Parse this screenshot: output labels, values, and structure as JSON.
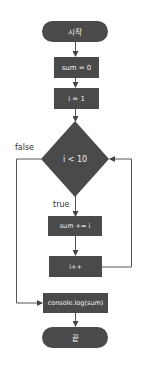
{
  "flowchart": {
    "colors": {
      "node_fill": "#4a4a4a",
      "node_text": "#f2f2f2",
      "line": "#555555",
      "label_text": "#333333",
      "background": "#ffffff"
    },
    "nodes": {
      "start": {
        "type": "terminal",
        "label": "시작"
      },
      "init_sum": {
        "type": "process",
        "label": "sum = 0"
      },
      "init_i": {
        "type": "process",
        "label": "i = 1"
      },
      "condition": {
        "type": "decision",
        "label": "i < 10"
      },
      "accumulate": {
        "type": "process",
        "label": "sum += i"
      },
      "increment": {
        "type": "process",
        "label": "i++"
      },
      "output": {
        "type": "process",
        "label": "console.log(sum)"
      },
      "end": {
        "type": "terminal",
        "label": "끝"
      }
    },
    "edges": {
      "true_label": "true",
      "false_label": "false"
    }
  }
}
